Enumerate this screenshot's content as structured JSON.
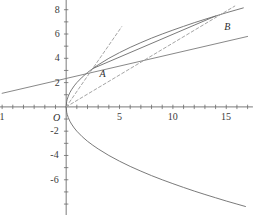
{
  "chart_data": {
    "type": "line",
    "title": "",
    "xlabel": "",
    "ylabel": "",
    "xlim": [
      -6.2,
      17.6
    ],
    "ylim": [
      -8.9,
      8.8
    ],
    "grid": false,
    "legend": null,
    "origin_label": "O",
    "xticks": [
      -6,
      -5,
      -4,
      -3,
      -2,
      -1,
      0,
      1,
      2,
      3,
      4,
      5,
      6,
      7,
      8,
      9,
      10,
      11,
      12,
      13,
      14,
      15,
      16,
      17
    ],
    "xtick_labels": [
      {
        "value": -6,
        "text": "1"
      },
      {
        "value": 5,
        "text": "5"
      },
      {
        "value": 10,
        "text": "10"
      },
      {
        "value": 15,
        "text": "15"
      }
    ],
    "yticks": [
      -8,
      -7,
      -6,
      -5,
      -4,
      -3,
      -2,
      -1,
      1,
      2,
      3,
      4,
      5,
      6,
      7,
      8
    ],
    "ytick_labels": [
      {
        "value": 8,
        "text": "8"
      },
      {
        "value": 6,
        "text": "6"
      },
      {
        "value": 4,
        "text": "4"
      },
      {
        "value": 2,
        "text": "2"
      },
      {
        "value": -2,
        "text": "-2"
      },
      {
        "value": -4,
        "text": "-4"
      },
      {
        "value": -6,
        "text": "-6"
      }
    ],
    "series": [
      {
        "name": "upper-branch",
        "style": "solid",
        "color": "#6b6b6b",
        "comment": "y = 2*sqrt(x) upper half of sideways parabola",
        "points": [
          [
            0.0,
            0.0
          ],
          [
            0.05,
            0.45
          ],
          [
            0.1,
            0.63
          ],
          [
            0.2,
            0.89
          ],
          [
            0.35,
            1.18
          ],
          [
            0.5,
            1.41
          ],
          [
            0.75,
            1.73
          ],
          [
            1.0,
            2.0
          ],
          [
            1.5,
            2.45
          ],
          [
            2.0,
            2.83
          ],
          [
            2.5,
            3.16
          ],
          [
            3.0,
            3.46
          ],
          [
            4.0,
            4.0
          ],
          [
            5.0,
            4.47
          ],
          [
            6.0,
            4.9
          ],
          [
            7.0,
            5.29
          ],
          [
            8.0,
            5.66
          ],
          [
            9.0,
            6.0
          ],
          [
            10.0,
            6.32
          ],
          [
            11.0,
            6.63
          ],
          [
            12.0,
            6.93
          ],
          [
            13.0,
            7.21
          ],
          [
            14.0,
            7.48
          ],
          [
            15.0,
            7.75
          ],
          [
            16.0,
            8.0
          ],
          [
            16.6,
            8.15
          ]
        ]
      },
      {
        "name": "lower-branch",
        "style": "solid",
        "color": "#6b6b6b",
        "comment": "y = -2*sqrt(x) lower half of sideways parabola",
        "points": [
          [
            0.0,
            0.0
          ],
          [
            0.05,
            -0.45
          ],
          [
            0.1,
            -0.63
          ],
          [
            0.2,
            -0.89
          ],
          [
            0.35,
            -1.18
          ],
          [
            0.5,
            -1.41
          ],
          [
            0.75,
            -1.73
          ],
          [
            1.0,
            -2.0
          ],
          [
            1.5,
            -2.45
          ],
          [
            2.0,
            -2.83
          ],
          [
            2.5,
            -3.16
          ],
          [
            3.0,
            -3.46
          ],
          [
            4.0,
            -4.0
          ],
          [
            5.0,
            -4.47
          ],
          [
            6.0,
            -4.9
          ],
          [
            7.0,
            -5.29
          ],
          [
            8.0,
            -5.66
          ],
          [
            9.0,
            -6.0
          ],
          [
            10.0,
            -6.32
          ],
          [
            11.0,
            -6.63
          ],
          [
            12.0,
            -6.93
          ],
          [
            13.0,
            -7.21
          ],
          [
            14.0,
            -7.48
          ],
          [
            15.0,
            -7.75
          ],
          [
            16.0,
            -8.0
          ],
          [
            16.8,
            -8.2
          ]
        ]
      },
      {
        "name": "tangent-line-at-A",
        "style": "solid",
        "color": "#7a7a7a",
        "comment": "tangent to the curve at point A, extended left past the y-axis",
        "points": [
          [
            -6.0,
            1.12
          ],
          [
            17.0,
            5.8
          ]
        ]
      },
      {
        "name": "chord-A-to-B",
        "style": "solid",
        "color": "#6b6b6b",
        "comment": "secant line joining A and B",
        "points": [
          [
            2.5,
            3.16
          ],
          [
            14.0,
            7.48
          ]
        ]
      },
      {
        "name": "secant-O-to-A",
        "style": "dashed",
        "color": "#9a9a9a",
        "comment": "dashed line from origin through A",
        "points": [
          [
            0.0,
            0.0
          ],
          [
            5.2,
            6.6
          ]
        ]
      },
      {
        "name": "secant-O-to-B",
        "style": "dashed",
        "color": "#9a9a9a",
        "comment": "dashed line from origin through B",
        "points": [
          [
            0.0,
            0.0
          ],
          [
            15.8,
            8.3
          ]
        ]
      }
    ],
    "annotations": [
      {
        "name": "point-A",
        "text": "A",
        "x": 3.4,
        "y": 2.72
      },
      {
        "name": "point-B",
        "text": "B",
        "x": 15.1,
        "y": 6.55
      },
      {
        "name": "origin",
        "text": "O",
        "x": -0.95,
        "y": -0.95
      }
    ],
    "axes": {
      "x_axis_color": "#6b6b6b",
      "y_axis_color": "#6b6b6b",
      "x_axis_range": [
        -6.2,
        17.5
      ],
      "y_axis_range": [
        -8.9,
        8.8
      ]
    }
  }
}
